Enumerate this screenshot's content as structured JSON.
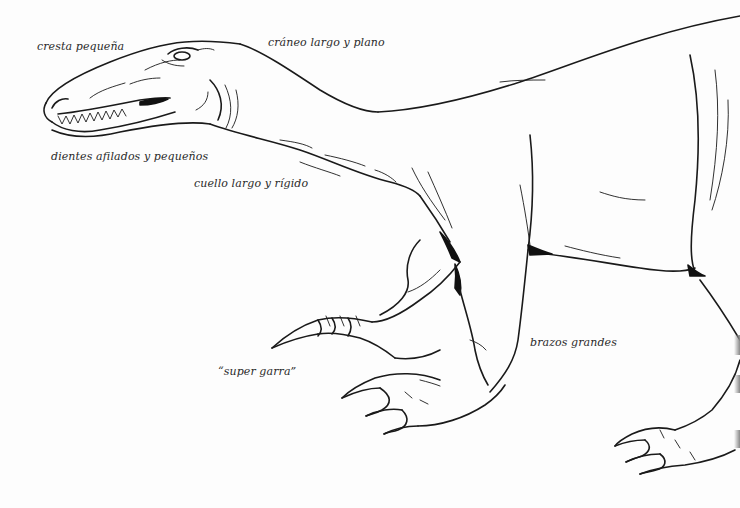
{
  "illustration": {
    "subject": "dinosaur-line-drawing",
    "stroke_color": "#1a1a1a",
    "background_color": "#fdfdfd"
  },
  "labels": [
    {
      "id": "crest",
      "text": "cresta pequeña"
    },
    {
      "id": "skull",
      "text": "cráneo largo y plano"
    },
    {
      "id": "teeth",
      "text": "dientes afilados y pequeños"
    },
    {
      "id": "neck",
      "text": "cuello largo y rígido"
    },
    {
      "id": "claw",
      "text": "“super garra”"
    },
    {
      "id": "arms",
      "text": "brazos grandes"
    }
  ]
}
